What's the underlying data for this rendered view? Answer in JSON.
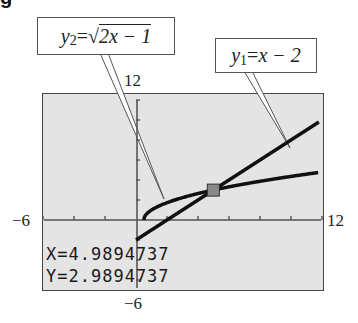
{
  "figure": {
    "partial_label": "g"
  },
  "callouts": {
    "y2": {
      "var": "y",
      "sub": "2",
      "eq": " = ",
      "radical": "√",
      "radicand": "2x − 1"
    },
    "y1": {
      "var": "y",
      "sub": "1",
      "eq": " = ",
      "rhs": "x − 2"
    }
  },
  "window": {
    "xmin_label": "−6",
    "xmax_label": "12",
    "ymin_label": "−6",
    "ymax_label": "12"
  },
  "trace": {
    "x_readout": "X=4.9894737",
    "y_readout": "Y=2.9894737"
  },
  "colors": {
    "screen_bg": "#e4e4e4",
    "curve": "#111111",
    "cursor": "#888888"
  },
  "chart_data": {
    "type": "line",
    "title": "",
    "xlabel": "",
    "ylabel": "",
    "xlim": [
      -6,
      12
    ],
    "ylim": [
      -6,
      12
    ],
    "xscl": 2,
    "yscl": 2,
    "grid": false,
    "series": [
      {
        "name": "y1 = x − 2",
        "function": "x - 2",
        "x": [
          -6,
          0,
          2,
          5,
          12
        ],
        "values": [
          -8,
          -2,
          0,
          3,
          10
        ]
      },
      {
        "name": "y2 = √(2x − 1)",
        "function": "sqrt(2x - 1)",
        "x": [
          0.5,
          1,
          2,
          5,
          12
        ],
        "values": [
          0,
          1,
          1.73,
          3,
          4.8
        ]
      }
    ],
    "annotations": [
      {
        "type": "intersection-cursor",
        "x": 4.9894737,
        "y": 2.9894737
      }
    ]
  }
}
